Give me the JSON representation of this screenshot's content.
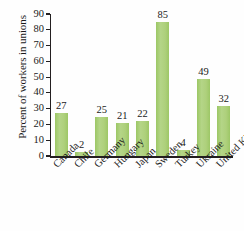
{
  "chart_data": {
    "type": "bar",
    "title": "",
    "xlabel": "",
    "ylabel": "Percent of workers in unions",
    "ylim": [
      0,
      90
    ],
    "yticks": [
      0,
      10,
      20,
      30,
      40,
      50,
      60,
      70,
      80,
      90
    ],
    "grid": false,
    "legend": null,
    "bar_color": "#a9ce74",
    "axis_color": "#231f20",
    "categories": [
      "Canada",
      "Chile",
      "Germany",
      "Hungary",
      "Japan",
      "Sweden",
      "Turkey",
      "Ukraine",
      "United Kingdom"
    ],
    "values": [
      27,
      2,
      25,
      21,
      22,
      85,
      4,
      49,
      32
    ],
    "data_labels": [
      "27",
      "2",
      "25",
      "21",
      "22",
      "85",
      "4",
      "49",
      "32"
    ],
    "ytick_labels": [
      "0",
      "10",
      "20",
      "30",
      "40",
      "50",
      "60",
      "70",
      "80",
      "90"
    ]
  }
}
